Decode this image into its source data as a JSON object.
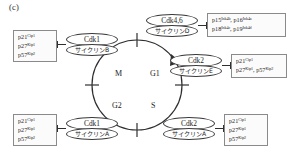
{
  "figure": {
    "panel_label": "(c)",
    "accent_color": "#2f2f2f",
    "box_border_color": "#8a8a8a",
    "ellipse_border_color": "#3a3a3a",
    "background": "#ffffff"
  },
  "cycle": {
    "phases": [
      {
        "name": "M",
        "label": "M"
      },
      {
        "name": "G1",
        "label": "G1"
      },
      {
        "name": "S",
        "label": "S"
      },
      {
        "name": "G2",
        "label": "G2"
      }
    ],
    "direction": "clockwise"
  },
  "complexes": {
    "cdk1_cyclinB": {
      "kinase": "Cdk1",
      "cyclin": "サイクリンB"
    },
    "cdk4_6_cyclinD": {
      "kinase": "Cdk4,6",
      "cyclin": "サイクリンD"
    },
    "cdk2_cyclinE": {
      "kinase": "Cdk2",
      "cyclin": "サイクリンE"
    },
    "cdk1_cyclinA": {
      "kinase": "Cdk1",
      "cyclin": "サイクリンA"
    },
    "cdk2_cyclinA": {
      "kinase": "Cdk2",
      "cyclin": "サイクリンA"
    }
  },
  "inhibitors": {
    "m_phase": {
      "lines": [
        {
          "name": "p21",
          "sup": "Cip1"
        },
        {
          "name": "p27",
          "sup": "Kip1"
        },
        {
          "name": "p57",
          "sup": "Kip2"
        }
      ]
    },
    "g1_ink4": {
      "lines": [
        {
          "text": "p15",
          "sup": "Ink4b",
          "text2": "p16",
          "sup2": "Ink4a"
        },
        {
          "text": "p18",
          "sup": "Ink4c",
          "text2": "p19",
          "sup2": "Ink4d"
        }
      ]
    },
    "g1_s_cip_kip": {
      "lines": [
        {
          "text": "p21",
          "sup": "Cip1",
          "text2": "",
          "sup2": ""
        },
        {
          "text": "p27",
          "sup": "Kip1",
          "text2": "p57",
          "sup2": "Kip2"
        }
      ]
    },
    "g2_phase": {
      "lines": [
        {
          "name": "p21",
          "sup": "Cip1"
        },
        {
          "name": "p27",
          "sup": "Kip1"
        },
        {
          "name": "p57",
          "sup": "Kip2"
        }
      ]
    },
    "s_phase": {
      "lines": [
        {
          "name": "p21",
          "sup": "Cip1"
        },
        {
          "name": "p27",
          "sup": "Kip1"
        },
        {
          "name": "p57",
          "sup": "Kip2"
        }
      ]
    }
  }
}
